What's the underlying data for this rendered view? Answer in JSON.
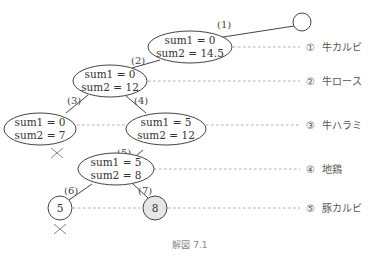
{
  "diagram": {
    "caption": "解図 7.1",
    "edges": [
      {
        "label": "(1)"
      },
      {
        "label": "(2)"
      },
      {
        "label": "(3)"
      },
      {
        "label": "(4)"
      },
      {
        "label": "(5)"
      },
      {
        "label": "(6)"
      },
      {
        "label": "(7)"
      }
    ],
    "nodes": {
      "root": {
        "line1": "sum1 = 0",
        "line2": "sum2 = 14.5"
      },
      "n2": {
        "line1": "sum1 = 0",
        "line2": "sum2 = 12"
      },
      "n3": {
        "line1": "sum1 = 0",
        "line2": "sum2 = 7"
      },
      "n4": {
        "line1": "sum1 = 5",
        "line2": "sum2 = 12"
      },
      "n5": {
        "line1": "sum1 = 5",
        "line2": "sum2 = 8"
      },
      "leaf_left": {
        "value": "5"
      },
      "leaf_right": {
        "value": "8"
      }
    },
    "levels": [
      {
        "num": "①",
        "name": "牛カルビ"
      },
      {
        "num": "②",
        "name": "牛ロース"
      },
      {
        "num": "③",
        "name": "牛ハラミ"
      },
      {
        "num": "④",
        "name": "地鶏"
      },
      {
        "num": "⑤",
        "name": "豚カルビ"
      }
    ],
    "colors": {
      "stroke": "#444444",
      "highlight_fill": "#e6e6e6",
      "dash": "#999999",
      "cross": "#888888"
    }
  }
}
